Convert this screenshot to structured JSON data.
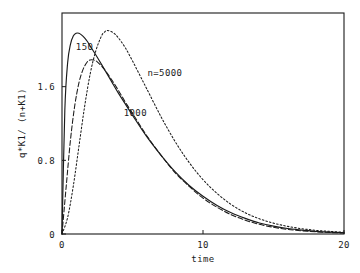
{
  "chart_data": {
    "type": "line",
    "title": "",
    "xlabel": "time",
    "ylabel": "q*K1/ (n+K1)",
    "xlim": [
      0,
      20
    ],
    "ylim": [
      0,
      2.4
    ],
    "xticks": [
      "0",
      "10",
      "20"
    ],
    "xtick_values": [
      0,
      10,
      20
    ],
    "yticks": [
      "0",
      "0.8",
      "1.6"
    ],
    "ytick_values": [
      0,
      0.8,
      1.6
    ],
    "grid": false,
    "legend_position": "inline-annotations",
    "annotations": [
      {
        "text": "150",
        "x": 1.6,
        "y": 2.0,
        "series": "n=150"
      },
      {
        "text": "n=5000",
        "x": 7.3,
        "y": 1.72,
        "series": "n=5000"
      },
      {
        "text": "1000",
        "x": 5.2,
        "y": 1.28,
        "series": "n=1000"
      }
    ],
    "series": [
      {
        "name": "n=150",
        "label": "150",
        "style": "solid",
        "x": [
          0,
          0.2,
          0.4,
          0.6,
          0.8,
          1.0,
          1.2,
          1.4,
          1.6,
          1.8,
          2.0,
          2.5,
          3.0,
          3.5,
          4.0,
          4.5,
          5.0,
          6.0,
          7.0,
          8.0,
          9.0,
          10.0,
          11.0,
          12.0,
          13.0,
          14.0,
          15.0,
          16.0,
          17.0,
          18.0,
          19.0,
          20.0
        ],
        "y": [
          0.0,
          1.34,
          1.86,
          2.06,
          2.15,
          2.18,
          2.18,
          2.16,
          2.13,
          2.09,
          2.04,
          1.92,
          1.79,
          1.66,
          1.53,
          1.41,
          1.29,
          1.06,
          0.86,
          0.68,
          0.53,
          0.41,
          0.31,
          0.23,
          0.17,
          0.12,
          0.085,
          0.06,
          0.042,
          0.029,
          0.02,
          0.014
        ]
      },
      {
        "name": "n=1000",
        "label": "1000",
        "style": "dash-dot",
        "x": [
          0,
          0.3,
          0.6,
          0.9,
          1.2,
          1.5,
          1.8,
          2.0,
          2.2,
          2.5,
          3.0,
          3.5,
          4.0,
          4.5,
          5.0,
          6.0,
          7.0,
          8.0,
          9.0,
          10.0,
          11.0,
          12.0,
          13.0,
          14.0,
          15.0,
          16.0,
          17.0,
          18.0,
          19.0,
          20.0
        ],
        "y": [
          0.0,
          0.52,
          1.02,
          1.39,
          1.64,
          1.79,
          1.87,
          1.89,
          1.89,
          1.87,
          1.79,
          1.68,
          1.56,
          1.43,
          1.31,
          1.07,
          0.86,
          0.67,
          0.52,
          0.39,
          0.29,
          0.21,
          0.15,
          0.105,
          0.073,
          0.05,
          0.035,
          0.024,
          0.016,
          0.011
        ]
      },
      {
        "name": "n=5000",
        "label": "n=5000",
        "style": "dotted",
        "x": [
          0,
          0.4,
          0.8,
          1.2,
          1.6,
          2.0,
          2.4,
          2.8,
          3.0,
          3.2,
          3.6,
          4.0,
          4.5,
          5.0,
          5.5,
          6.0,
          7.0,
          8.0,
          9.0,
          10.0,
          11.0,
          12.0,
          13.0,
          14.0,
          15.0,
          16.0,
          17.0,
          18.0,
          19.0,
          20.0
        ],
        "y": [
          0.0,
          0.18,
          0.52,
          0.95,
          1.38,
          1.74,
          1.99,
          2.15,
          2.19,
          2.21,
          2.19,
          2.13,
          2.02,
          1.88,
          1.73,
          1.58,
          1.28,
          1.01,
          0.78,
          0.59,
          0.44,
          0.32,
          0.23,
          0.165,
          0.118,
          0.083,
          0.058,
          0.04,
          0.028,
          0.019
        ]
      }
    ]
  }
}
